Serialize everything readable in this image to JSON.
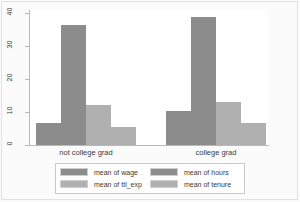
{
  "chart_data": {
    "type": "bar",
    "title": "",
    "subtitle": "",
    "xlabel": "",
    "ylabel": "",
    "categories": [
      "not college grad",
      "college grad"
    ],
    "series": [
      {
        "name": "mean of wage",
        "values": [
          6.8,
          10.4
        ],
        "color": "#8c8c8c"
      },
      {
        "name": "mean of hours",
        "values": [
          36.6,
          38.9
        ],
        "color": "#8c8c8c"
      },
      {
        "name": "mean of ttl_exp",
        "values": [
          12.1,
          13.2
        ],
        "color": "#b0b0b0"
      },
      {
        "name": "mean of tenure",
        "values": [
          5.5,
          6.7
        ],
        "color": "#b0b0b0"
      }
    ],
    "ylim": [
      0,
      41
    ],
    "yticks": [
      0,
      10,
      20,
      30,
      40
    ],
    "ytick_labels": [
      "0",
      "10",
      "20",
      "30",
      "40"
    ],
    "grid": false,
    "legend_position": "bottom"
  },
  "legend": {
    "entries": [
      {
        "label": "mean of wage",
        "tone": "dark"
      },
      {
        "label": "mean of hours",
        "tone": "dark"
      },
      {
        "label": "mean of ttl_exp",
        "tone": "light"
      },
      {
        "label": "mean of tenure",
        "tone": "light"
      }
    ]
  },
  "colors": {
    "bar_dark": "#8c8c8c",
    "bar_light": "#b0b0b0",
    "axis": "#b9b9b9",
    "text": "#3a3a3a",
    "page_background": "#fbfbfb",
    "plot_background": "#ffffff"
  }
}
